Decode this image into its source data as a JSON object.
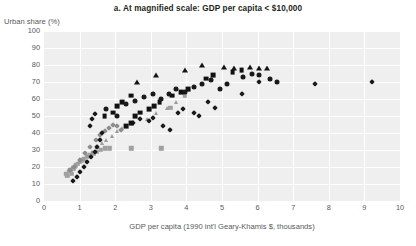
{
  "chart_data": {
    "type": "scatter",
    "title": "a. At magnified scale: GDP per capita < $10,000",
    "xlabel": "GDP per capita (1990 int'l Geary-Khamis $, thousands)",
    "ylabel": "Urban share (%)",
    "xlim": [
      0,
      10
    ],
    "ylim": [
      0,
      100
    ],
    "xticks": [
      0,
      1,
      2,
      3,
      4,
      5,
      6,
      7,
      8,
      9,
      10
    ],
    "yticks": [
      0,
      10,
      20,
      30,
      40,
      50,
      60,
      70,
      80,
      90,
      100
    ],
    "grid": "both",
    "legend": "none",
    "plot_background": "#efefef",
    "gridline_color": "#ffffff",
    "series": [
      {
        "name": "gray-squares",
        "marker": "square",
        "color": "#a0a0a0",
        "size": 4.4,
        "points": [
          [
            0.62,
            16
          ],
          [
            0.66,
            15
          ],
          [
            0.7,
            17
          ],
          [
            0.74,
            18
          ],
          [
            0.78,
            16
          ],
          [
            0.82,
            19
          ],
          [
            0.86,
            20
          ],
          [
            0.9,
            21
          ],
          [
            0.95,
            22
          ],
          [
            1.0,
            23
          ],
          [
            1.05,
            24
          ],
          [
            1.12,
            25
          ],
          [
            1.2,
            26
          ],
          [
            1.28,
            27
          ],
          [
            1.38,
            28
          ],
          [
            1.48,
            29
          ],
          [
            1.6,
            30
          ],
          [
            1.72,
            31
          ],
          [
            1.85,
            31
          ],
          [
            2.45,
            31
          ],
          [
            3.3,
            31
          ],
          [
            3.55,
            55
          ],
          [
            3.95,
            62
          ]
        ]
      },
      {
        "name": "gray-triangles",
        "marker": "triangle",
        "color": "#9a9a9a",
        "size": 4.6,
        "points": [
          [
            0.8,
            20
          ],
          [
            0.88,
            21
          ],
          [
            0.98,
            23
          ],
          [
            1.1,
            25
          ],
          [
            1.22,
            27
          ],
          [
            1.35,
            29
          ],
          [
            1.5,
            32
          ],
          [
            1.62,
            34
          ],
          [
            1.75,
            36
          ],
          [
            1.9,
            38
          ],
          [
            2.05,
            41
          ],
          [
            2.2,
            43
          ],
          [
            2.9,
            48
          ],
          [
            3.15,
            52
          ],
          [
            3.45,
            55
          ],
          [
            3.7,
            58
          ]
        ]
      },
      {
        "name": "gray-diamonds",
        "marker": "diamond",
        "color": "#8c8c8c",
        "size": 4.0,
        "points": [
          [
            0.72,
            18
          ],
          [
            0.85,
            20
          ],
          [
            1.0,
            24
          ],
          [
            1.15,
            28
          ],
          [
            1.3,
            32
          ],
          [
            1.45,
            36
          ],
          [
            1.58,
            39
          ],
          [
            1.7,
            41
          ],
          [
            1.82,
            43
          ],
          [
            1.95,
            45
          ],
          [
            2.05,
            44
          ],
          [
            2.15,
            42
          ]
        ]
      },
      {
        "name": "black-diamonds",
        "marker": "diamond",
        "color": "#1a1a1a",
        "size": 4.2,
        "points": [
          [
            0.82,
            12
          ],
          [
            0.92,
            14
          ],
          [
            1.02,
            17
          ],
          [
            1.12,
            20
          ],
          [
            1.22,
            23
          ],
          [
            1.32,
            26
          ],
          [
            1.42,
            29
          ],
          [
            1.5,
            32
          ],
          [
            1.58,
            36
          ],
          [
            1.64,
            40
          ],
          [
            1.3,
            44
          ],
          [
            1.36,
            48
          ],
          [
            1.44,
            51
          ],
          [
            2.5,
            46
          ],
          [
            2.7,
            48
          ],
          [
            2.95,
            47
          ],
          [
            3.05,
            49
          ],
          [
            3.35,
            44
          ],
          [
            3.55,
            42
          ],
          [
            3.75,
            52
          ],
          [
            3.9,
            54
          ],
          [
            4.2,
            52
          ],
          [
            4.35,
            50
          ],
          [
            4.6,
            58
          ],
          [
            4.8,
            55
          ],
          [
            5.55,
            63
          ],
          [
            6.05,
            70
          ],
          [
            7.6,
            69
          ],
          [
            9.2,
            70
          ]
        ]
      },
      {
        "name": "black-squares",
        "marker": "square",
        "color": "#111111",
        "size": 4.8,
        "points": [
          [
            1.7,
            50
          ],
          [
            1.95,
            52
          ],
          [
            2.3,
            44
          ],
          [
            2.45,
            46
          ],
          [
            2.55,
            50
          ],
          [
            2.7,
            52
          ],
          [
            2.95,
            54
          ],
          [
            3.1,
            56
          ],
          [
            3.25,
            58
          ],
          [
            2.05,
            56
          ],
          [
            2.2,
            58
          ],
          [
            2.45,
            62
          ],
          [
            3.6,
            62
          ],
          [
            3.85,
            64
          ],
          [
            4.05,
            66
          ],
          [
            4.55,
            72
          ],
          [
            4.75,
            74
          ],
          [
            5.3,
            76
          ],
          [
            5.55,
            77
          ]
        ]
      },
      {
        "name": "black-circles",
        "marker": "circle",
        "color": "#1a1a1a",
        "size": 5.0,
        "points": [
          [
            1.75,
            54
          ],
          [
            2.05,
            50
          ],
          [
            2.3,
            57
          ],
          [
            2.55,
            59
          ],
          [
            2.8,
            61
          ],
          [
            3.05,
            63
          ],
          [
            3.3,
            60
          ],
          [
            3.5,
            63
          ],
          [
            3.7,
            66
          ],
          [
            3.95,
            64
          ],
          [
            4.2,
            67
          ],
          [
            4.45,
            69
          ],
          [
            4.7,
            71
          ],
          [
            4.95,
            66
          ],
          [
            5.15,
            69
          ],
          [
            5.6,
            73
          ],
          [
            5.85,
            75
          ],
          [
            6.05,
            74
          ],
          [
            6.35,
            72
          ],
          [
            6.55,
            70
          ]
        ]
      },
      {
        "name": "black-triangles",
        "marker": "triangle",
        "color": "#141414",
        "size": 5.0,
        "points": [
          [
            2.6,
            70
          ],
          [
            3.15,
            74
          ],
          [
            3.95,
            77
          ],
          [
            4.45,
            80
          ],
          [
            5.05,
            79
          ],
          [
            5.35,
            78
          ],
          [
            5.8,
            79
          ],
          [
            6.05,
            78
          ],
          [
            6.25,
            78
          ]
        ]
      }
    ]
  }
}
